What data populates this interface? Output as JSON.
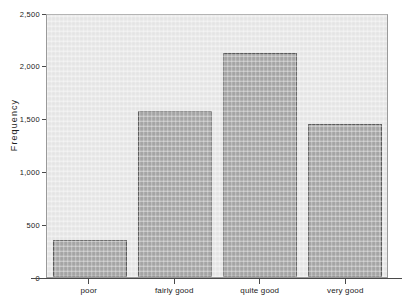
{
  "chart_data": {
    "type": "bar",
    "title": "",
    "title_clipped_text": "",
    "xlabel": "",
    "ylabel": "Frequency",
    "categories": [
      "poor",
      "fairly good",
      "quite good",
      "very good"
    ],
    "values": [
      355,
      1570,
      2125,
      1445
    ],
    "ylim": [
      0,
      2500
    ],
    "y_ticks": [
      0,
      500,
      1000,
      1500,
      2000,
      2500
    ],
    "y_tick_labels": [
      "0",
      "500",
      "1,000",
      "1,500",
      "2,000",
      "2,500"
    ],
    "grid": false,
    "legend": false,
    "bar_fill_color": "#a8a8a8",
    "bar_border_color": "#5c5c5c",
    "plot_background_color": "#eaeaea",
    "page_background_color": "#ffffff",
    "axis_color": "#4a4a4a"
  },
  "axes": {
    "y_title": "Frequency"
  }
}
